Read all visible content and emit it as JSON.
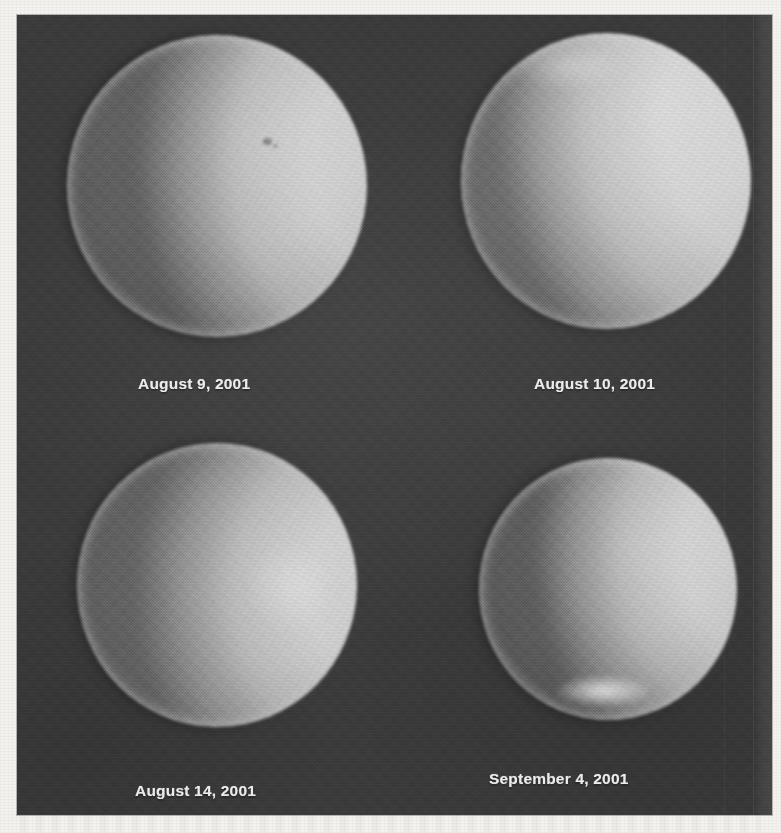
{
  "figure": {
    "kind": "photographic-plate",
    "panel_count": 4,
    "layout": "2x2 grid",
    "background_color": "#3b3b3b",
    "disk_color": "#d2d2d2",
    "caption_color": "#efefef",
    "page_color": "#f3f2ef"
  },
  "panels": [
    {
      "id": "panel-1",
      "caption": "August 9, 2001",
      "position": "top-left",
      "phase": "gibbous",
      "illuminated_limb": "upper-right",
      "terminator_side": "left",
      "relative_size": "largest"
    },
    {
      "id": "panel-2",
      "caption": "August 10, 2001",
      "position": "top-right",
      "phase": "gibbous",
      "illuminated_limb": "upper-right",
      "terminator_side": "lower-left",
      "relative_size": "large"
    },
    {
      "id": "panel-3",
      "caption": "August 14, 2001",
      "position": "bottom-left",
      "phase": "gibbous",
      "illuminated_limb": "right",
      "terminator_side": "upper-left",
      "relative_size": "medium"
    },
    {
      "id": "panel-4",
      "caption": "September 4, 2001",
      "position": "bottom-right",
      "phase": "gibbous",
      "illuminated_limb": "upper-right",
      "terminator_side": "left",
      "relative_size": "smallest",
      "feature": "bright spot at lower limb"
    }
  ]
}
